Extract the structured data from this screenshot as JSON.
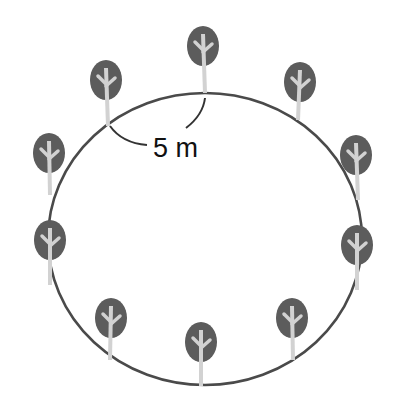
{
  "diagram": {
    "tree_count": 10,
    "spacing_label": "5 m",
    "colors": {
      "path": "#4a4a4a",
      "crown": "#5c5c5c",
      "trunk": "#d2d2d2",
      "background": "#ffffff",
      "text": "#111111"
    }
  }
}
